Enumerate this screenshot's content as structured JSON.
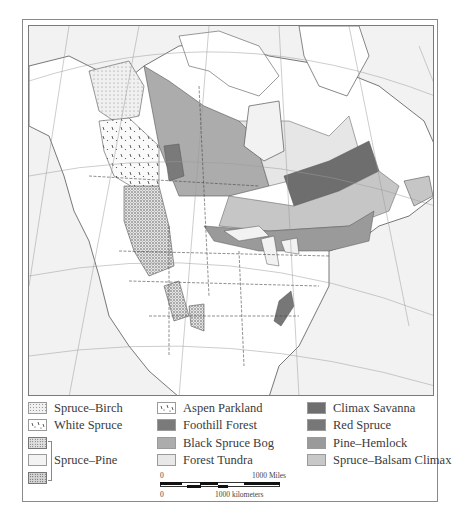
{
  "map": {
    "region": "North America",
    "description": "Boreal and montane forest regions of North America"
  },
  "legend": {
    "column1": [
      {
        "label": "Spruce–Birch",
        "pattern": "fine-dots",
        "color": "#ececec"
      },
      {
        "label": "White Spruce",
        "pattern": "dashes-dots",
        "color": "#f2f2f2"
      },
      {
        "label": "",
        "pattern": "dense-stipple",
        "color": "#d8d8d8"
      },
      {
        "label": "Spruce–Pine",
        "pattern": "sparse-dots",
        "color": "#f0f0f0"
      },
      {
        "label": "",
        "pattern": "dense-stipple-dark",
        "color": "#d0d0d0"
      }
    ],
    "spruce_pine_label": "Spruce–Pine",
    "column2": [
      {
        "label": "Aspen Parkland",
        "pattern": "dashes-dots",
        "color": "#f4f4f4"
      },
      {
        "label": "Foothill Forest",
        "pattern": "solid",
        "color": "#7a7a7a"
      },
      {
        "label": "Black Spruce Bog",
        "pattern": "solid",
        "color": "#acacac"
      },
      {
        "label": "Forest Tundra",
        "pattern": "solid",
        "color": "#e6e6e6"
      }
    ],
    "column3": [
      {
        "label": "Climax Savanna",
        "pattern": "solid",
        "color": "#6e6e6e"
      },
      {
        "label": "Red Spruce",
        "pattern": "solid",
        "color": "#777777"
      },
      {
        "label": "Pine–Hemlock",
        "pattern": "solid",
        "color": "#9a9a9a"
      },
      {
        "label": "Spruce–Balsam Climax",
        "pattern": "solid",
        "color": "#c6c6c6"
      }
    ]
  },
  "scale_bar": {
    "miles_start": "0",
    "miles_end": "1000 Miles",
    "km_start": "0",
    "km_end": "1000 kilometers"
  },
  "colors": {
    "ocean": "#f2f2f2",
    "land": "#ffffff",
    "border": "#555555",
    "graticule": "#9a9a9a"
  }
}
